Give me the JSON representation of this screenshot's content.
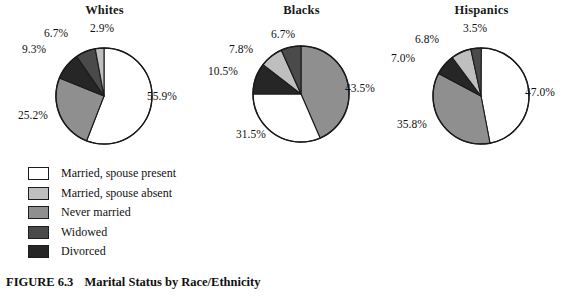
{
  "caption": {
    "figure_number": "FIGURE 6.3",
    "title": "Marital Status by Race/Ethnicity"
  },
  "legend": {
    "items": [
      {
        "label": "Married, spouse present",
        "color": "#ffffff"
      },
      {
        "label": "Married, spouse absent",
        "color": "#bfbfbf"
      },
      {
        "label": "Never married",
        "color": "#8f8f8f"
      },
      {
        "label": "Widowed",
        "color": "#4a4a4a"
      },
      {
        "label": "Divorced",
        "color": "#262626"
      }
    ]
  },
  "panels": [
    {
      "title": "Whites",
      "labels": [
        "55.9%",
        "25.2%",
        "9.3%",
        "6.7%",
        "2.9%"
      ]
    },
    {
      "title": "Blacks",
      "labels": [
        "43.5%",
        "31.5%",
        "10.5%",
        "7.8%",
        "6.7%"
      ]
    },
    {
      "title": "Hispanics",
      "labels": [
        "47.0%",
        "35.8%",
        "7.0%",
        "6.8%",
        "3.5%"
      ]
    }
  ],
  "chart_data": {
    "type": "pie",
    "title": "Marital Status by Race/Ethnicity",
    "subtitle": "FIGURE 6.3",
    "units": "percent",
    "categories": [
      "Married, spouse present",
      "Married, spouse absent",
      "Never married",
      "Widowed",
      "Divorced"
    ],
    "category_colors": [
      "#ffffff",
      "#bfbfbf",
      "#8f8f8f",
      "#4a4a4a",
      "#262626"
    ],
    "legend_position": "bottom-left",
    "series": [
      {
        "name": "Whites",
        "values": [
          55.9,
          2.9,
          25.2,
          6.7,
          9.3
        ],
        "slice_order_clockwise_from_top": [
          {
            "category": "Married, spouse present",
            "value": 55.9
          },
          {
            "category": "Never married",
            "value": 25.2
          },
          {
            "category": "Divorced",
            "value": 9.3
          },
          {
            "category": "Widowed",
            "value": 6.7
          },
          {
            "category": "Married, spouse absent",
            "value": 2.9
          }
        ]
      },
      {
        "name": "Blacks",
        "values": [
          31.5,
          7.8,
          43.5,
          6.7,
          10.5
        ],
        "slice_order_clockwise_from_top": [
          {
            "category": "Never married",
            "value": 43.5
          },
          {
            "category": "Married, spouse present",
            "value": 31.5
          },
          {
            "category": "Divorced",
            "value": 10.5
          },
          {
            "category": "Married, spouse absent",
            "value": 7.8
          },
          {
            "category": "Widowed",
            "value": 6.7
          }
        ]
      },
      {
        "name": "Hispanics",
        "values": [
          47.0,
          6.8,
          35.8,
          3.5,
          7.0
        ],
        "slice_order_clockwise_from_top": [
          {
            "category": "Married, spouse present",
            "value": 47.0
          },
          {
            "category": "Never married",
            "value": 35.8
          },
          {
            "category": "Divorced",
            "value": 7.0
          },
          {
            "category": "Married, spouse absent",
            "value": 6.8
          },
          {
            "category": "Widowed",
            "value": 3.5
          }
        ]
      }
    ]
  }
}
